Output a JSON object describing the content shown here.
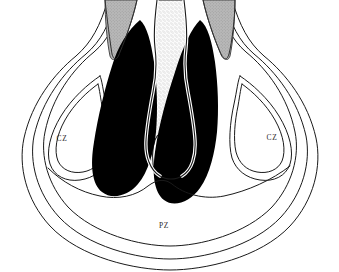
{
  "figure": {
    "type": "anatomical-cross-section",
    "background_color": "#ffffff",
    "outline_color": "#1a1a1a",
    "mass_fill_color": "#000000",
    "duct_fill_color": "#b4b4b4",
    "urethra_fill_color": "#f0f0f0",
    "stipple_dot_color": "#8a8a8a"
  },
  "labels": {
    "central_zone_left": "CZ",
    "central_zone_right": "CZ",
    "peripheral_zone": "PZ"
  },
  "label_positions": {
    "central_zone_left": {
      "x": 62,
      "y": 139
    },
    "central_zone_right": {
      "x": 272,
      "y": 138
    },
    "peripheral_zone": {
      "x": 164,
      "y": 226
    }
  },
  "regions": [
    {
      "name": "peripheral-zone",
      "abbreviation": "PZ",
      "fill": "#ffffff",
      "description": "outer crescent region spanning the lower half of the gland"
    },
    {
      "name": "central-zone-left",
      "abbreviation": "CZ",
      "fill": "#ffffff",
      "description": "left wedge-shaped zone lateral to the dark mass"
    },
    {
      "name": "central-zone-right",
      "abbreviation": "CZ",
      "fill": "#ffffff",
      "description": "right wedge-shaped zone lateral to the dark mass"
    },
    {
      "name": "transition-zone-left",
      "abbreviation": "",
      "fill": "#000000",
      "description": "large solid black teardrop mass left of the urethra"
    },
    {
      "name": "transition-zone-right",
      "abbreviation": "",
      "fill": "#000000",
      "description": "large solid black teardrop mass right of the urethra"
    },
    {
      "name": "ejaculatory-duct-left",
      "abbreviation": "",
      "fill": "#b4b4b4",
      "description": "grey hatched tapering wedge at upper left"
    },
    {
      "name": "ejaculatory-duct-right",
      "abbreviation": "",
      "fill": "#b4b4b4",
      "description": "grey hatched tapering wedge at upper right"
    },
    {
      "name": "urethra",
      "abbreviation": "",
      "fill": "#f0f0f0",
      "description": "central stippled vertical channel widening toward the base"
    },
    {
      "name": "verumontanum",
      "abbreviation": "",
      "fill": "#ffffff",
      "description": "inverted-U structure within the lower urethral channel"
    }
  ],
  "contours": {
    "capsule_outer": "outermost thin closed contour of the gland",
    "capsule_middle": "second nested contour paralleling the outer capsule",
    "capsule_inner": "third nested contour bounding the peripheral zone"
  }
}
